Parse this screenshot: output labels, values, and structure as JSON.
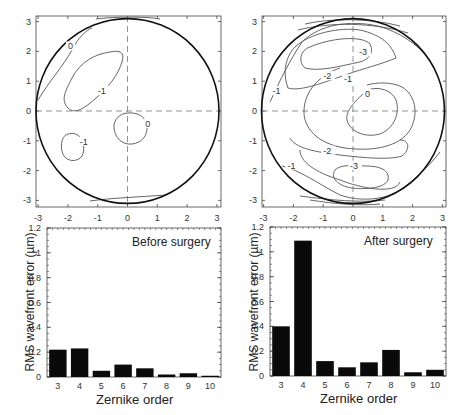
{
  "chart_data": [
    {
      "type": "contour",
      "title": "",
      "xlabel": "",
      "ylabel": "",
      "xlim": [
        -3.2,
        3.2
      ],
      "ylim": [
        -3.2,
        3.2
      ],
      "x_ticks": [
        "-3",
        "-2",
        "-1",
        "0",
        "1",
        "2",
        "3"
      ],
      "y_ticks": [
        "3",
        "2",
        "1",
        "0",
        "-1",
        "-2",
        "-3"
      ],
      "contour_labels": [
        {
          "label": "0",
          "x": -1.9,
          "y": 2.1
        },
        {
          "label": "-1",
          "x": -0.9,
          "y": 0.6
        },
        {
          "label": "0",
          "x": 0.7,
          "y": -0.5
        },
        {
          "label": "-1",
          "x": -1.5,
          "y": -1.1
        }
      ]
    },
    {
      "type": "contour",
      "title": "",
      "xlabel": "",
      "ylabel": "",
      "xlim": [
        -3.2,
        3.2
      ],
      "ylim": [
        -3.2,
        3.2
      ],
      "x_ticks": [
        "-3",
        "-2",
        "-1",
        "0",
        "1",
        "2",
        "3"
      ],
      "y_ticks": [
        "3",
        "2",
        "1",
        "0",
        "-1",
        "-2",
        "-3"
      ],
      "contour_labels": [
        {
          "label": "-3",
          "x": 0.3,
          "y": 1.9
        },
        {
          "label": "-2",
          "x": -0.9,
          "y": 1.1
        },
        {
          "label": "-1",
          "x": -0.2,
          "y": 1.0
        },
        {
          "label": "-1",
          "x": -2.6,
          "y": 0.6
        },
        {
          "label": "0",
          "x": 0.5,
          "y": 0.5
        },
        {
          "label": "-2",
          "x": -0.9,
          "y": -1.4
        },
        {
          "label": "-3",
          "x": 0.0,
          "y": -1.9
        },
        {
          "label": "-1",
          "x": -2.1,
          "y": -1.9
        }
      ]
    },
    {
      "type": "bar",
      "title": "Before surgery",
      "xlabel": "Zernike order",
      "ylabel": "RMS wavefront error (µm)",
      "ylim": [
        0,
        1.2
      ],
      "y_ticks": [
        "0",
        "0.2",
        "0.4",
        "0.6",
        "0.8",
        "1",
        "1.2"
      ],
      "categories": [
        "3",
        "4",
        "5",
        "6",
        "7",
        "8",
        "9",
        "10"
      ],
      "values": [
        0.22,
        0.23,
        0.05,
        0.1,
        0.07,
        0.02,
        0.03,
        0.01
      ]
    },
    {
      "type": "bar",
      "title": "After surgery",
      "xlabel": "Zernike order",
      "ylabel": "RMS wavefront error (µm)",
      "ylim": [
        0,
        1.2
      ],
      "y_ticks": [
        "0",
        "0.2",
        "0.4",
        "0.6",
        "0.8",
        "1",
        "1.2"
      ],
      "categories": [
        "3",
        "4",
        "5",
        "6",
        "7",
        "8",
        "9",
        "10"
      ],
      "values": [
        0.4,
        1.09,
        0.12,
        0.07,
        0.11,
        0.21,
        0.03,
        0.05
      ]
    }
  ],
  "panels": {
    "before_label": "Before surgery",
    "after_label": "After surgery",
    "xlabel": "Zernike order",
    "ylabel": "RMS wavefront error (µm)"
  },
  "colors": {
    "bar": "#0a0a0a",
    "contour": "#555555",
    "circle": "#111111",
    "axis": "#444444"
  }
}
